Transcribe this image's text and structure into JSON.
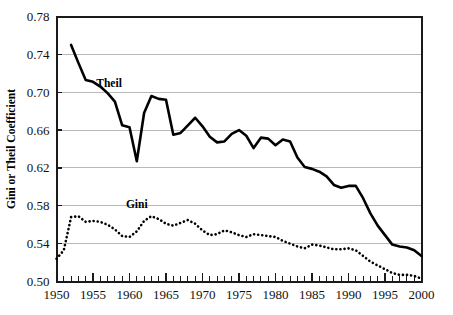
{
  "chart_data": {
    "type": "line",
    "title": "",
    "xlabel": "",
    "ylabel": "Gini or Theil Coefficient",
    "xlim": [
      1950,
      2000
    ],
    "ylim": [
      0.5,
      0.78
    ],
    "ytick_labels": [
      "0.50",
      "0.54",
      "0.58",
      "0.62",
      "0.66",
      "0.70",
      "0.74",
      "0.78"
    ],
    "ytick_values": [
      0.5,
      0.54,
      0.58,
      0.62,
      0.66,
      0.7,
      0.74,
      0.78
    ],
    "xtick_labels": [
      "1950",
      "1955",
      "1960",
      "1965",
      "1970",
      "1975",
      "1980",
      "1985",
      "1990",
      "1995",
      "2000"
    ],
    "xtick_values": [
      1950,
      1955,
      1960,
      1965,
      1970,
      1975,
      1980,
      1985,
      1990,
      1995,
      2000
    ],
    "xtick_minor_step": 1,
    "grid": "horizontal",
    "legend": "inline-annotations",
    "annotations": [
      {
        "text": "Theil",
        "x": 1957.2,
        "y": 0.706
      },
      {
        "text": "Gini",
        "x": 1961.0,
        "y": 0.578
      }
    ],
    "series": [
      {
        "name": "Theil",
        "style": "solid",
        "x": [
          1952,
          1953,
          1954,
          1955,
          1956,
          1957,
          1958,
          1959,
          1960,
          1961,
          1962,
          1963,
          1964,
          1965,
          1966,
          1967,
          1968,
          1969,
          1970,
          1971,
          1972,
          1973,
          1974,
          1975,
          1976,
          1977,
          1978,
          1979,
          1980,
          1981,
          1982,
          1983,
          1984,
          1985,
          1986,
          1987,
          1988,
          1989,
          1990,
          1991,
          1992,
          1993,
          1994,
          1995,
          1996,
          1997,
          1998,
          1999,
          2000
        ],
        "y": [
          0.75,
          0.731,
          0.713,
          0.711,
          0.706,
          0.699,
          0.69,
          0.665,
          0.663,
          0.627,
          0.678,
          0.696,
          0.693,
          0.692,
          0.655,
          0.657,
          0.665,
          0.673,
          0.664,
          0.653,
          0.647,
          0.648,
          0.656,
          0.66,
          0.654,
          0.641,
          0.652,
          0.651,
          0.644,
          0.65,
          0.648,
          0.631,
          0.621,
          0.619,
          0.616,
          0.611,
          0.602,
          0.599,
          0.601,
          0.601,
          0.588,
          0.572,
          0.559,
          0.549,
          0.539,
          0.537,
          0.536,
          0.533,
          0.527
        ]
      },
      {
        "name": "Gini",
        "style": "dotted",
        "x": [
          1950,
          1951,
          1952,
          1953,
          1954,
          1955,
          1956,
          1957,
          1958,
          1959,
          1960,
          1961,
          1962,
          1963,
          1964,
          1965,
          1966,
          1967,
          1968,
          1969,
          1970,
          1971,
          1972,
          1973,
          1974,
          1975,
          1976,
          1977,
          1978,
          1979,
          1980,
          1981,
          1982,
          1983,
          1984,
          1985,
          1986,
          1987,
          1988,
          1989,
          1990,
          1991,
          1992,
          1993,
          1994,
          1995,
          1996,
          1997,
          1998,
          1999,
          2000
        ],
        "y": [
          0.524,
          0.533,
          0.568,
          0.569,
          0.563,
          0.564,
          0.563,
          0.56,
          0.555,
          0.548,
          0.547,
          0.553,
          0.564,
          0.569,
          0.566,
          0.561,
          0.559,
          0.562,
          0.565,
          0.561,
          0.554,
          0.549,
          0.55,
          0.554,
          0.552,
          0.549,
          0.547,
          0.55,
          0.549,
          0.548,
          0.547,
          0.543,
          0.54,
          0.537,
          0.535,
          0.539,
          0.538,
          0.536,
          0.534,
          0.534,
          0.535,
          0.533,
          0.527,
          0.521,
          0.517,
          0.513,
          0.509,
          0.507,
          0.507,
          0.506,
          0.503
        ]
      }
    ]
  },
  "colors": {
    "line": "#000000",
    "grid": "#b9b9b9",
    "frame": "#1a1a1a",
    "background": "#ffffff"
  }
}
